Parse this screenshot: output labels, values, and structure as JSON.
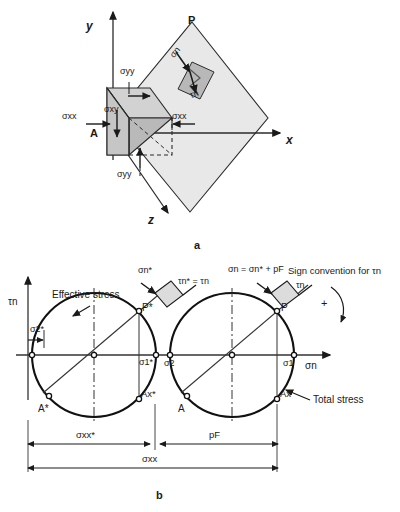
{
  "figure": {
    "panel_a_caption": "a",
    "panel_b_caption": "b"
  },
  "panel_a": {
    "name": "3d-stress-element-on-inclined-plane",
    "axes": {
      "y": "y",
      "x": "x",
      "z": "z"
    },
    "plane_label": "P",
    "corner_label": "A",
    "stress_labels": {
      "sigma_yy_top": "σyy",
      "sigma_yy_bottom": "σyy",
      "sigma_xx_left": "σxx",
      "sigma_xx_right": "σxx",
      "sigma_xy": "σxy",
      "sigma_n": "σn",
      "tau_n": "τn"
    },
    "colors": {
      "plane_fill": "#e6e6e6",
      "wedge_fill": "#bfbfbf",
      "inner_square_fill": "#bcbcbc",
      "line": "#1a1a1a"
    }
  },
  "panel_b": {
    "name": "mohr-circles-effective-and-total-stress",
    "axis_x_label": "σn",
    "axis_y_label": "τn",
    "annotations": {
      "effective_stress": "Effective stress",
      "total_stress": "Total stress",
      "sign_convention": "Sign convention for τn",
      "sign_plus": "+",
      "element_left_sigma": "σn*",
      "element_left_tau": "τn* = τn",
      "element_right_sigma": "σn = σn* + pF",
      "element_right_tau": "τn"
    },
    "point_labels": {
      "P_star": "P*",
      "P": "P",
      "A_star": "A*",
      "A": "A",
      "Ax_star": "Ax*",
      "Ax": "Ax",
      "sigma2_star": "σ2*",
      "sigma1_star": "σ1*",
      "sigma2": "σ2",
      "sigma1": "σ1"
    },
    "dimension_labels": {
      "sigma_xx_star": "σxx*",
      "p_F": "pF",
      "sigma_xx": "σxx"
    },
    "chart_geometry": {
      "type": "mohr-circle",
      "baseline_y": 355,
      "circle_effective": {
        "center_x": 94,
        "center_y": 355,
        "radius": 62
      },
      "circle_total": {
        "center_x": 232,
        "center_y": 355,
        "radius": 62
      },
      "sigma2_star_x": 32,
      "sigma1_star_x": 156,
      "sigma2_x": 170,
      "sigma1_x": 294,
      "p_star_x": 139,
      "p_star_y": 311,
      "p_x": 277,
      "p_y": 311,
      "a_star_x": 49,
      "a_star_y": 399,
      "a_x": 187,
      "a_y": 399,
      "ax_star_x": 139,
      "ax_star_y": 399,
      "ax_x": 277,
      "ax_y": 399
    },
    "colors": {
      "circle_stroke": "#111111",
      "axis": "#333333",
      "element_fill": "#d8d8d8"
    }
  }
}
